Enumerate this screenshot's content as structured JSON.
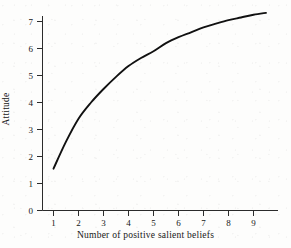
{
  "figure": {
    "background_color": "#fdfdfc",
    "curve_color": "#111111",
    "axis_color": "#2b2b2b"
  },
  "chart_data": {
    "type": "line",
    "title": "",
    "xlabel": "Number of positive salient beliefs",
    "ylabel": "Attitude",
    "xlim": [
      0,
      9.5
    ],
    "ylim": [
      0,
      7.6
    ],
    "grid": false,
    "legend": false,
    "x_ticks": [
      1,
      2,
      3,
      4,
      5,
      6,
      7,
      8,
      9
    ],
    "x_tick_labels": [
      "1",
      "2",
      "3",
      "4",
      "5",
      "6",
      "7",
      "8",
      "9"
    ],
    "y_ticks": [
      0,
      1,
      2,
      3,
      4,
      5,
      6,
      7
    ],
    "y_tick_labels": [
      "0",
      "1",
      "2",
      "3",
      "4",
      "5",
      "6",
      "7"
    ],
    "series": [
      {
        "name": "Attitude vs number of positive salient beliefs",
        "x": [
          1,
          1.5,
          2,
          2.5,
          3,
          3.5,
          4,
          4.5,
          5,
          5.5,
          6,
          6.5,
          7,
          7.5,
          8,
          8.5,
          9,
          9.5
        ],
        "values": [
          1.55,
          2.55,
          3.4,
          4.0,
          4.5,
          4.95,
          5.35,
          5.65,
          5.9,
          6.2,
          6.42,
          6.6,
          6.78,
          6.92,
          7.05,
          7.15,
          7.25,
          7.32
        ]
      }
    ]
  }
}
